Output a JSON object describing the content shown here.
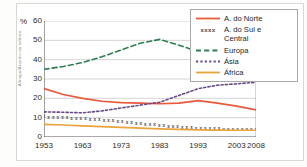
{
  "credit": "Almapa/Arquivo da editora",
  "chart_data": {
    "type": "line",
    "title": "",
    "subtitle": "",
    "xlabel": "",
    "ylabel": "%",
    "ylim": [
      0,
      60
    ],
    "yticks": [
      0,
      10,
      20,
      30,
      40,
      50,
      60
    ],
    "xlim": [
      1953,
      2008
    ],
    "xticks": [
      1953,
      1963,
      1973,
      1983,
      1993,
      2003,
      2008
    ],
    "xtick_labels": [
      "1953",
      "1963",
      "1973",
      "1983",
      "1993",
      "2003",
      "2008"
    ],
    "grid": true,
    "grid_axis": "y",
    "legend_position": "top-right",
    "x": [
      1953,
      1958,
      1963,
      1968,
      1973,
      1978,
      1983,
      1988,
      1993,
      1998,
      2003,
      2008
    ],
    "series": [
      {
        "name": "A. do Norte",
        "color": "#e8593c",
        "style": "solid",
        "values": [
          25.0,
          22.0,
          20.0,
          18.5,
          17.8,
          17.5,
          17.2,
          17.5,
          18.8,
          17.5,
          16.0,
          14.0
        ]
      },
      {
        "name": "A. do Sul e Central",
        "color": "#4a4a4a",
        "style": "x-markers",
        "values": [
          10.5,
          10.0,
          9.5,
          8.8,
          8.0,
          7.0,
          6.0,
          5.2,
          4.6,
          4.2,
          4.1,
          4.0
        ]
      },
      {
        "name": "Europa",
        "color": "#2e7d52",
        "style": "dashed",
        "values": [
          35.0,
          36.5,
          38.5,
          41.5,
          45.0,
          48.5,
          50.5,
          47.5,
          44.2,
          45.0,
          45.5,
          41.5
        ]
      },
      {
        "name": "Ásia",
        "color": "#6b4b86",
        "style": "dotted",
        "values": [
          13.0,
          12.8,
          12.5,
          13.5,
          15.0,
          16.5,
          18.0,
          21.5,
          25.0,
          26.8,
          27.5,
          28.3
        ]
      },
      {
        "name": "África",
        "color": "#e8a33d",
        "style": "solid",
        "values": [
          6.5,
          6.2,
          5.8,
          5.4,
          5.0,
          4.6,
          4.2,
          3.9,
          3.7,
          3.6,
          3.5,
          3.5
        ]
      }
    ]
  },
  "legend": {
    "items": [
      {
        "label": "A. do Norte",
        "key": "solid-red",
        "marker_text": ""
      },
      {
        "label": "A. do Sul e\nCentral",
        "key": "x-markers",
        "marker_text": "xxxx"
      },
      {
        "label": "Europa",
        "key": "dashed-green",
        "marker_text": ""
      },
      {
        "label": "Ásia",
        "key": "dotted-purple",
        "marker_text": ""
      },
      {
        "label": "África",
        "key": "solid-orange",
        "marker_text": ""
      }
    ]
  }
}
